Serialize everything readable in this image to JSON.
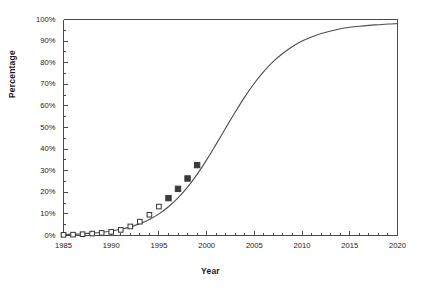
{
  "chart_data": {
    "type": "line",
    "title": "",
    "xlabel": "Year",
    "ylabel": "Percentage",
    "xlim": [
      1985,
      2020
    ],
    "ylim": [
      0,
      100
    ],
    "grid": false,
    "legend": null,
    "x_tick_labels": [
      "1985",
      "1990",
      "1995",
      "2000",
      "2005",
      "2010",
      "2015",
      "2020"
    ],
    "x_tick_values": [
      1985,
      1990,
      1995,
      2000,
      2005,
      2010,
      2015,
      2020
    ],
    "x_minor_tick_step": 1,
    "y_tick_labels": [
      "0%",
      "10%",
      "20%",
      "30%",
      "40%",
      "50%",
      "60%",
      "70%",
      "80%",
      "90%",
      "100%"
    ],
    "y_tick_values": [
      0,
      10,
      20,
      30,
      40,
      50,
      60,
      70,
      80,
      90,
      100
    ],
    "y_minor_tick_step": 5,
    "series": [
      {
        "name": "Fitted logistic curve",
        "type": "line",
        "color": "#4d4d4d",
        "x": [
          1985,
          1986,
          1987,
          1988,
          1989,
          1990,
          1991,
          1992,
          1993,
          1994,
          1995,
          1996,
          1997,
          1998,
          1999,
          2000,
          2001,
          2002,
          2003,
          2004,
          2005,
          2006,
          2007,
          2008,
          2009,
          2010,
          2011,
          2012,
          2013,
          2014,
          2015,
          2016,
          2017,
          2018,
          2019,
          2020
        ],
        "values": [
          0.4,
          0.6,
          0.8,
          1.1,
          1.5,
          2.1,
          2.9,
          4.0,
          5.5,
          7.4,
          10.0,
          13.3,
          17.4,
          22.4,
          28.3,
          35.0,
          42.3,
          49.8,
          57.2,
          64.2,
          70.5,
          76.0,
          80.6,
          84.4,
          87.5,
          90.0,
          91.9,
          93.5,
          94.7,
          95.7,
          96.4,
          96.9,
          97.3,
          97.6,
          97.9,
          98.1
        ]
      },
      {
        "name": "Observed data (historic)",
        "type": "scatter",
        "marker": "open-square",
        "color": "#333333",
        "fill": "#ffffff",
        "x": [
          1985,
          1986,
          1987,
          1988,
          1989,
          1990,
          1991,
          1992,
          1993,
          1994,
          1995
        ],
        "values": [
          0.3,
          0.4,
          0.6,
          0.9,
          1.2,
          1.7,
          2.6,
          4.2,
          6.4,
          9.6,
          13.4
        ]
      },
      {
        "name": "Observed data (recent)",
        "type": "scatter",
        "marker": "filled-square",
        "color": "#3a3a3a",
        "fill": "#3a3a3a",
        "x": [
          1996,
          1997,
          1998,
          1999
        ],
        "values": [
          17.3,
          21.6,
          26.4,
          32.6
        ]
      }
    ]
  },
  "axes": {
    "y_title": "Percentage",
    "x_title": "Year"
  }
}
